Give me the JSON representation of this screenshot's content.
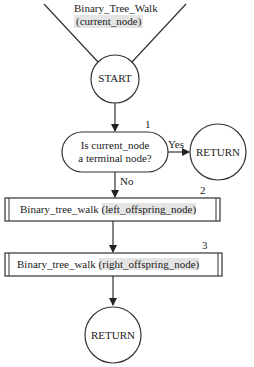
{
  "diagram": {
    "type": "flowchart",
    "entry": {
      "name": "Binary_Tree_Walk",
      "param": "(current_node)"
    },
    "nodes": [
      {
        "id": "start",
        "shape": "circle",
        "label": "START"
      },
      {
        "id": "decision",
        "shape": "oval",
        "number": "1",
        "line1": "Is current_node",
        "line2": "a terminal node?"
      },
      {
        "id": "return1",
        "shape": "circle",
        "label": "RETURN"
      },
      {
        "id": "call_left",
        "shape": "subroutine-box",
        "number": "2",
        "func": "Binary_tree_walk",
        "arg": "(left_offspring_node)"
      },
      {
        "id": "call_right",
        "shape": "subroutine-box",
        "number": "3",
        "func": "Binary_tree_walk",
        "arg": "(right_offspring_node)"
      },
      {
        "id": "return2",
        "shape": "circle",
        "label": "RETURN"
      }
    ],
    "edges": [
      {
        "from": "start",
        "to": "decision",
        "label": ""
      },
      {
        "from": "decision",
        "to": "return1",
        "label": "Yes"
      },
      {
        "from": "decision",
        "to": "call_left",
        "label": "No"
      },
      {
        "from": "call_left",
        "to": "call_right",
        "label": ""
      },
      {
        "from": "call_right",
        "to": "return2",
        "label": ""
      }
    ],
    "colors": {
      "line": "#333333",
      "highlight": "#e4e4e4",
      "background": "#ffffff"
    }
  }
}
